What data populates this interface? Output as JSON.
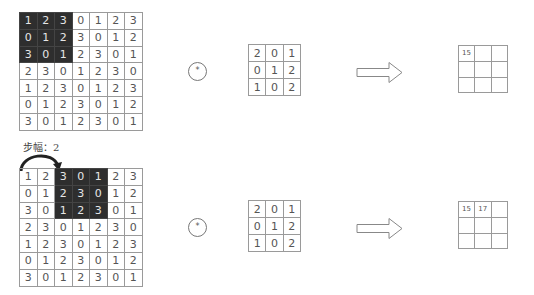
{
  "diagrams": [
    {
      "input": {
        "rows": [
          [
            "1",
            "2",
            "3",
            "0",
            "1",
            "2",
            "3"
          ],
          [
            "0",
            "1",
            "2",
            "3",
            "0",
            "1",
            "2"
          ],
          [
            "3",
            "0",
            "1",
            "2",
            "3",
            "0",
            "1"
          ],
          [
            "2",
            "3",
            "0",
            "1",
            "2",
            "3",
            "0"
          ],
          [
            "1",
            "2",
            "3",
            "0",
            "1",
            "2",
            "3"
          ],
          [
            "0",
            "1",
            "2",
            "3",
            "0",
            "1",
            "2"
          ],
          [
            "3",
            "0",
            "1",
            "2",
            "3",
            "0",
            "1"
          ]
        ],
        "highlight": {
          "row_start": 0,
          "col_start": 0,
          "size": 3
        }
      },
      "operator": "*",
      "kernel": {
        "rows": [
          [
            "2",
            "0",
            "1"
          ],
          [
            "0",
            "1",
            "2"
          ],
          [
            "1",
            "0",
            "2"
          ]
        ]
      },
      "output": {
        "rows": [
          [
            "15",
            "",
            ""
          ],
          [
            "",
            "",
            ""
          ],
          [
            "",
            "",
            ""
          ]
        ]
      }
    },
    {
      "stride_label": "步幅：2",
      "input": {
        "rows": [
          [
            "1",
            "2",
            "3",
            "0",
            "1",
            "2",
            "3"
          ],
          [
            "0",
            "1",
            "2",
            "3",
            "0",
            "1",
            "2"
          ],
          [
            "3",
            "0",
            "1",
            "2",
            "3",
            "0",
            "1"
          ],
          [
            "2",
            "3",
            "0",
            "1",
            "2",
            "3",
            "0"
          ],
          [
            "1",
            "2",
            "3",
            "0",
            "1",
            "2",
            "3"
          ],
          [
            "0",
            "1",
            "2",
            "3",
            "0",
            "1",
            "2"
          ],
          [
            "3",
            "0",
            "1",
            "2",
            "3",
            "0",
            "1"
          ]
        ],
        "highlight": {
          "row_start": 0,
          "col_start": 2,
          "size": 3
        }
      },
      "operator": "*",
      "kernel": {
        "rows": [
          [
            "2",
            "0",
            "1"
          ],
          [
            "0",
            "1",
            "2"
          ],
          [
            "1",
            "0",
            "2"
          ]
        ]
      },
      "output": {
        "rows": [
          [
            "15",
            "17",
            ""
          ],
          [
            "",
            "",
            ""
          ],
          [
            "",
            "",
            ""
          ]
        ]
      }
    }
  ],
  "colors": {
    "highlight_bg": "#2e2e2e",
    "grid_line": "#9a9a9a",
    "text": "#555555"
  }
}
